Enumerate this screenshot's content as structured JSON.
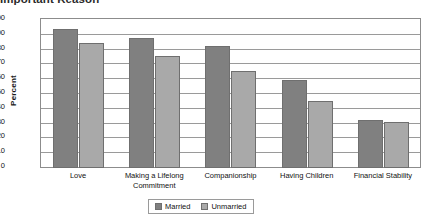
{
  "chart_data": {
    "type": "bar",
    "title": "Important  Reason",
    "xlabel": "",
    "ylabel": "Percent",
    "ylim": [
      0,
      100
    ],
    "ytick_step": 10,
    "yticks": [
      "100",
      "90",
      "80",
      "70",
      "60",
      "50",
      "40",
      "30",
      "20",
      "10",
      "0"
    ],
    "grid": true,
    "legend_position": "bottom-center",
    "categories": [
      "Love",
      "Making a Lifelong Commitment",
      "Companionship",
      "Having Children",
      "Financial Stability"
    ],
    "category_lines": [
      [
        "Love"
      ],
      [
        "Making a Lifelong",
        "Commitment"
      ],
      [
        "Companionship"
      ],
      [
        "Having Children"
      ],
      [
        "Financial Stability"
      ]
    ],
    "series": [
      {
        "name": "Married",
        "color": "#808080",
        "values": [
          93,
          87,
          82,
          59,
          32
        ]
      },
      {
        "name": "Unmarried",
        "color": "#a9a9a9",
        "values": [
          84,
          75,
          65,
          45,
          31
        ]
      }
    ]
  },
  "legend": {
    "items": [
      {
        "label": "Married",
        "color": "#808080"
      },
      {
        "label": "Unmarried",
        "color": "#a9a9a9"
      }
    ]
  }
}
